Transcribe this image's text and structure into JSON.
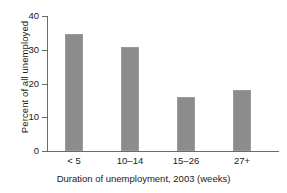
{
  "chart_data": {
    "type": "bar",
    "title": "",
    "subtitle": "",
    "categories": [
      "< 5",
      "10–14",
      "15–26",
      "27+"
    ],
    "values": [
      34.7,
      30.8,
      16.1,
      18.2
    ],
    "xlabel": "Duration of unemployment, 2003 (weeks)",
    "ylabel": "Percent of all unemployed",
    "ylim": [
      0,
      40
    ],
    "yticks": [
      0,
      10,
      20,
      30,
      40
    ],
    "ytick_labels": [
      "0",
      "10",
      "20",
      "30",
      "40"
    ],
    "grid": false,
    "legend": null,
    "bar_color": "#8c8c8c",
    "axis_color": "#6b6b6b",
    "text_color": "#1a1a1a"
  }
}
